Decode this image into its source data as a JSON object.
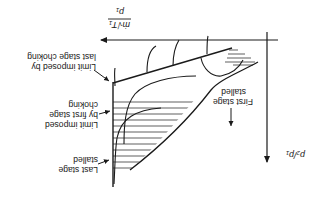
{
  "figure": {
    "orientation": "rotated-180",
    "x_axis": {
      "label_num": "ṁ√T₁",
      "label_den": "p₁"
    },
    "y_axis": {
      "label": "p₂/p₁"
    },
    "annotations": {
      "last_stage_choking": [
        "Limit imposed by",
        "last stage choking"
      ],
      "first_stage_choking": [
        "Limit imposed",
        "by first stage",
        "choking"
      ],
      "last_stage_stalled": [
        "Last stage",
        "stalled"
      ],
      "first_stage_stalled": [
        "First stage",
        "stalled"
      ]
    },
    "colors": {
      "ink": "#1a1a1a",
      "background": "#ffffff"
    }
  }
}
